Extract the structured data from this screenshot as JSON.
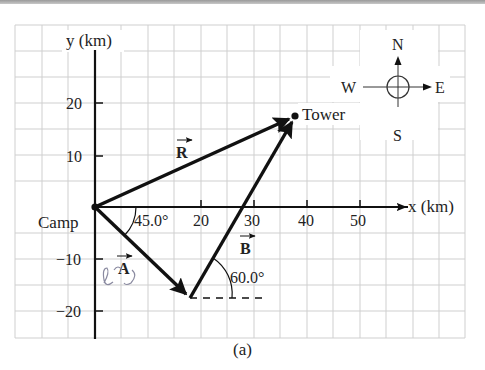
{
  "figure": {
    "caption": "(a)",
    "axes": {
      "x_label": "x (km)",
      "y_label": "y (km)",
      "x_ticks": [
        "20",
        "30",
        "40",
        "50"
      ],
      "y_ticks": [
        "20",
        "10",
        "−10",
        "−20"
      ]
    },
    "points": {
      "origin_label": "Camp",
      "destination_label": "Tower"
    },
    "vectors": {
      "A": {
        "label": "A",
        "angle_label": "45.0°"
      },
      "B": {
        "label": "B",
        "angle_label": "60.0°"
      },
      "R": {
        "label": "R"
      }
    },
    "compass": {
      "north": "N",
      "south": "S",
      "east": "E",
      "west": "W"
    },
    "annotation": {
      "handwritten_mark": "ℓ"
    },
    "colors": {
      "grid": "#c9c9c9",
      "ink": "#111111",
      "background": "#ffffff"
    }
  }
}
